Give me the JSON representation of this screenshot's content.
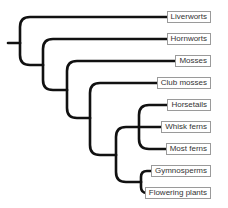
{
  "diagram": {
    "type": "phylogenetic-tree",
    "line_color": "#111111",
    "label_border_color": "#9a9a9a",
    "taxa": [
      {
        "name": "Liverworts",
        "y": 17
      },
      {
        "name": "Hornworts",
        "y": 39
      },
      {
        "name": "Mosses",
        "y": 61
      },
      {
        "name": "Club mosses",
        "y": 83
      },
      {
        "name": "Horsetails",
        "y": 105
      },
      {
        "name": "Whisk ferns",
        "y": 127
      },
      {
        "name": "Most ferns",
        "y": 149
      },
      {
        "name": "Gymnosperms",
        "y": 171
      },
      {
        "name": "Flowering plants",
        "y": 193
      }
    ],
    "clades": [
      {
        "id": "land-plants",
        "children": [
          "Liverworts",
          "clade-2"
        ]
      },
      {
        "id": "clade-2",
        "children": [
          "Hornworts",
          "clade-3"
        ]
      },
      {
        "id": "clade-3",
        "children": [
          "Mosses",
          "vascular-plants"
        ]
      },
      {
        "id": "vascular-plants",
        "children": [
          "Club mosses",
          "euphyllophytes"
        ]
      },
      {
        "id": "euphyllophytes",
        "children": [
          "ferns-and-allies",
          "seed-plants"
        ]
      },
      {
        "id": "ferns-and-allies",
        "children": [
          "Horsetails",
          "Whisk ferns",
          "Most ferns"
        ]
      },
      {
        "id": "seed-plants",
        "children": [
          "Gymnosperms",
          "Flowering plants"
        ]
      }
    ]
  }
}
